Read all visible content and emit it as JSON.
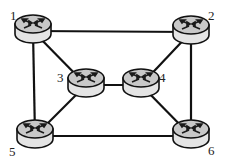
{
  "diagram": {
    "type": "network-topology",
    "colors": {
      "background": "#ffffff",
      "edge": "#111111",
      "router_top": "#c8c8c8",
      "router_side": "#e4e4e4",
      "router_outline": "#111111",
      "label": "#222222"
    },
    "nodes": [
      {
        "id": "1",
        "label": "1",
        "icon": "router-icon",
        "x": 33,
        "y": 28,
        "lx": 10,
        "ly": 20
      },
      {
        "id": "2",
        "label": "2",
        "icon": "router-icon",
        "x": 191,
        "y": 29,
        "lx": 208,
        "ly": 20
      },
      {
        "id": "3",
        "label": "3",
        "icon": "router-icon",
        "x": 86,
        "y": 82,
        "lx": 57,
        "ly": 82
      },
      {
        "id": "4",
        "label": "4",
        "icon": "router-icon",
        "x": 141,
        "y": 82,
        "lx": 159,
        "ly": 82
      },
      {
        "id": "5",
        "label": "5",
        "icon": "router-icon",
        "x": 35,
        "y": 133,
        "lx": 9,
        "ly": 156
      },
      {
        "id": "6",
        "label": "6",
        "icon": "router-icon",
        "x": 191,
        "y": 133,
        "lx": 208,
        "ly": 155
      }
    ],
    "edges": [
      {
        "from": "1",
        "to": "2"
      },
      {
        "from": "1",
        "to": "5"
      },
      {
        "from": "1",
        "to": "3"
      },
      {
        "from": "2",
        "to": "4"
      },
      {
        "from": "2",
        "to": "6"
      },
      {
        "from": "3",
        "to": "4"
      },
      {
        "from": "3",
        "to": "5"
      },
      {
        "from": "4",
        "to": "6"
      },
      {
        "from": "5",
        "to": "6"
      }
    ]
  }
}
